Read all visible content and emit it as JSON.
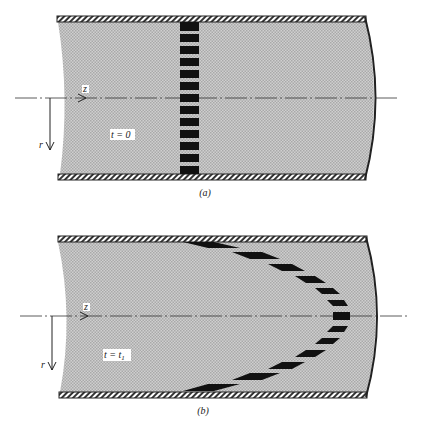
{
  "figure": {
    "panels": [
      {
        "id": "a",
        "caption": "(a)",
        "time_label": "t = 0",
        "axis_z": "z",
        "axis_r": "r",
        "marker_shape": "vertical stack of rectangles",
        "marker_count": 13
      },
      {
        "id": "b",
        "caption": "(b)",
        "time_label_main": "t = t",
        "time_label_sub": "1",
        "axis_z": "z",
        "axis_r": "r",
        "marker_shape": "parabolic velocity profile",
        "marker_count": 13
      }
    ],
    "colors": {
      "fluid_fill": "#c8c8c8",
      "wall_hatch": "#333333",
      "marker": "#111111",
      "background": "#ffffff"
    }
  }
}
